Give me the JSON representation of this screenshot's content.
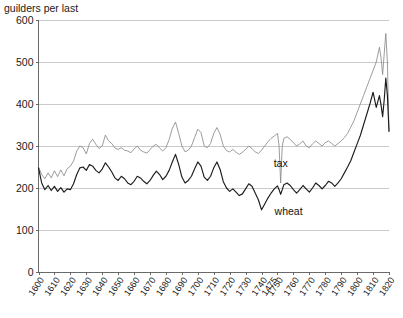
{
  "chart_data": {
    "type": "line",
    "title": "guilders per last",
    "xlabel": "",
    "ylabel": "guilders per last",
    "ylim": [
      0,
      600
    ],
    "xlim": [
      1600,
      1820
    ],
    "yticks": [
      0,
      100,
      200,
      300,
      400,
      500,
      600
    ],
    "xticks": [
      1600,
      1610,
      1620,
      1630,
      1640,
      1650,
      1660,
      1670,
      1680,
      1690,
      1700,
      1710,
      1720,
      1730,
      1740,
      1475,
      1750,
      1760,
      1770,
      1780,
      1790,
      1800,
      1810,
      1820
    ],
    "grid": true,
    "legend_position": "inline-annotations",
    "annotations": [
      {
        "text": "tax",
        "x": 1752,
        "y": 250
      },
      {
        "text": "wheat",
        "x": 1757,
        "y": 135
      }
    ],
    "colors": {
      "tax": "#8a8a8a",
      "wheat": "#1c1c1c",
      "grid": "#bdbdbd",
      "axis": "#5a5a5a",
      "background": "#ffffff"
    },
    "series": [
      {
        "name": "tax",
        "color": "#8a8a8a",
        "x": [
          1600,
          1602,
          1604,
          1606,
          1608,
          1610,
          1612,
          1614,
          1616,
          1618,
          1620,
          1622,
          1624,
          1626,
          1628,
          1630,
          1632,
          1634,
          1636,
          1638,
          1640,
          1642,
          1644,
          1646,
          1648,
          1650,
          1652,
          1654,
          1656,
          1658,
          1660,
          1662,
          1664,
          1666,
          1668,
          1670,
          1672,
          1674,
          1676,
          1678,
          1680,
          1682,
          1684,
          1686,
          1688,
          1690,
          1692,
          1694,
          1696,
          1698,
          1700,
          1702,
          1704,
          1706,
          1708,
          1710,
          1712,
          1714,
          1716,
          1718,
          1720,
          1722,
          1724,
          1726,
          1728,
          1730,
          1732,
          1734,
          1736,
          1738,
          1740,
          1742,
          1744,
          1746,
          1748,
          1750,
          1751,
          1752,
          1753,
          1754,
          1756,
          1758,
          1760,
          1762,
          1764,
          1766,
          1768,
          1770,
          1772,
          1774,
          1776,
          1778,
          1780,
          1782,
          1784,
          1786,
          1788,
          1790,
          1792,
          1794,
          1796,
          1798,
          1800,
          1802,
          1804,
          1806,
          1808,
          1810,
          1812,
          1814,
          1815,
          1816,
          1817,
          1818,
          1819,
          1820
        ],
        "values": [
          250,
          232,
          222,
          236,
          224,
          241,
          227,
          243,
          229,
          246,
          252,
          264,
          288,
          300,
          296,
          281,
          306,
          316,
          304,
          294,
          300,
          326,
          312,
          306,
          295,
          292,
          296,
          290,
          288,
          284,
          293,
          300,
          290,
          286,
          283,
          291,
          300,
          304,
          295,
          288,
          296,
          315,
          342,
          357,
          330,
          300,
          286,
          290,
          300,
          320,
          340,
          332,
          300,
          296,
          306,
          330,
          344,
          328,
          300,
          289,
          286,
          292,
          285,
          280,
          285,
          292,
          300,
          294,
          286,
          282,
          290,
          300,
          310,
          318,
          324,
          330,
          300,
          212,
          300,
          318,
          322,
          316,
          308,
          300,
          305,
          312,
          300,
          296,
          305,
          312,
          306,
          300,
          308,
          312,
          306,
          300,
          306,
          312,
          320,
          330,
          345,
          360,
          380,
          400,
          420,
          440,
          460,
          480,
          500,
          535,
          510,
          470,
          520,
          568,
          500,
          335
        ]
      },
      {
        "name": "wheat",
        "color": "#1c1c1c",
        "x": [
          1600,
          1602,
          1604,
          1606,
          1608,
          1610,
          1612,
          1614,
          1616,
          1618,
          1620,
          1622,
          1624,
          1626,
          1628,
          1630,
          1632,
          1634,
          1636,
          1638,
          1640,
          1642,
          1644,
          1646,
          1648,
          1650,
          1652,
          1654,
          1656,
          1658,
          1660,
          1662,
          1664,
          1666,
          1668,
          1670,
          1672,
          1674,
          1676,
          1678,
          1680,
          1682,
          1684,
          1686,
          1688,
          1690,
          1692,
          1694,
          1696,
          1698,
          1700,
          1702,
          1704,
          1706,
          1708,
          1710,
          1712,
          1714,
          1716,
          1718,
          1720,
          1722,
          1724,
          1726,
          1728,
          1730,
          1732,
          1734,
          1736,
          1738,
          1740,
          1742,
          1744,
          1746,
          1748,
          1750,
          1751,
          1752,
          1753,
          1754,
          1756,
          1758,
          1760,
          1762,
          1764,
          1766,
          1768,
          1770,
          1772,
          1774,
          1776,
          1778,
          1780,
          1782,
          1784,
          1786,
          1788,
          1790,
          1792,
          1794,
          1796,
          1798,
          1800,
          1802,
          1804,
          1806,
          1808,
          1810,
          1812,
          1814,
          1815,
          1816,
          1817,
          1818,
          1819,
          1820
        ],
        "values": [
          248,
          212,
          196,
          206,
          194,
          204,
          192,
          201,
          190,
          198,
          196,
          210,
          232,
          248,
          250,
          242,
          256,
          252,
          242,
          236,
          245,
          260,
          250,
          238,
          224,
          218,
          228,
          222,
          212,
          208,
          216,
          228,
          224,
          216,
          210,
          218,
          230,
          240,
          232,
          220,
          228,
          242,
          262,
          280,
          256,
          226,
          212,
          218,
          228,
          246,
          262,
          252,
          226,
          218,
          228,
          248,
          262,
          244,
          215,
          200,
          192,
          198,
          190,
          182,
          186,
          198,
          210,
          204,
          188,
          172,
          148,
          162,
          176,
          188,
          198,
          205,
          196,
          185,
          196,
          208,
          212,
          206,
          196,
          188,
          196,
          206,
          198,
          190,
          200,
          212,
          206,
          198,
          206,
          216,
          212,
          204,
          212,
          222,
          236,
          250,
          265,
          285,
          305,
          325,
          350,
          375,
          400,
          428,
          392,
          420,
          398,
          370,
          410,
          462,
          420,
          335
        ]
      }
    ]
  },
  "axis": {
    "y_title": "guilders per last",
    "y_tick_600": "600",
    "y_tick_500": "500",
    "y_tick_400": "400",
    "y_tick_300": "300",
    "y_tick_200": "200",
    "y_tick_100": "100",
    "y_tick_0": "0"
  },
  "labels": {
    "tax": "tax",
    "wheat": "wheat"
  }
}
